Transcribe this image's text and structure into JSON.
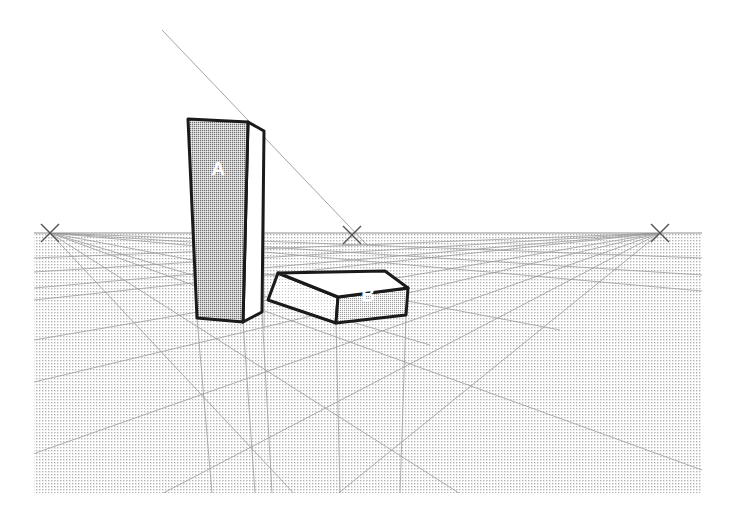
{
  "diagram": {
    "type": "perspective-drawing",
    "canvas": {
      "width": 734,
      "height": 523,
      "background": "#ffffff"
    },
    "colors": {
      "outline": "#1a1a1a",
      "construction_line": "#9a9a9a",
      "ground_fill": "#c9c9c9",
      "face_dark": "#8c8c8c",
      "face_mid": "#bfbfbf",
      "face_light": "#e2e2e2",
      "face_white": "#ffffff",
      "label_text": "#ffffff",
      "vanishing_mark": "#555555"
    },
    "horizon": {
      "y": 233,
      "x_start": 34,
      "x_end": 702
    },
    "ground_plane": {
      "x": 34,
      "y": 233,
      "width": 668,
      "height": 260
    },
    "vanishing_points": [
      {
        "name": "vp-left",
        "label": "X",
        "x": 50,
        "y": 233
      },
      {
        "name": "vp-center",
        "label": "X",
        "x": 352,
        "y": 235
      },
      {
        "name": "vp-right",
        "label": "X",
        "x": 660,
        "y": 233
      }
    ],
    "objects": [
      {
        "name": "tower-a",
        "label": "A",
        "label_x": 218,
        "label_y": 175,
        "description": "tall vertical slab block, dark stippled front face",
        "front_face": {
          "fill": "#8c8c8c",
          "points": "188,119 248,122 243,322 197,318"
        },
        "side_face": {
          "fill": "#ffffff",
          "points": "248,122 264,131 262,312 243,322"
        },
        "top_edge": "188,119 248,122 264,131"
      },
      {
        "name": "box-b",
        "label": "B",
        "label_x": 368,
        "label_y": 301,
        "description": "low flat slab block to the right, white top face",
        "top_face": {
          "fill": "#ffffff",
          "points": "278,273 385,271 408,288 338,297"
        },
        "left_face": {
          "fill": "#dcdcdc",
          "points": "278,273 338,297 336,323 268,300"
        },
        "right_face": {
          "fill": "#a8a8a8",
          "points": "338,297 408,288 406,315 336,323"
        }
      }
    ],
    "construction_lines_count": 22
  }
}
